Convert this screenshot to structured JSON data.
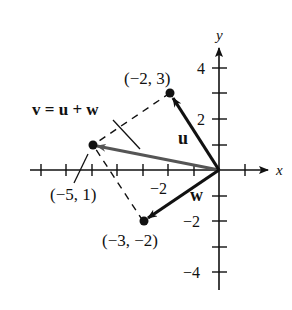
{
  "diagram": {
    "axes": {
      "x_label": "x",
      "y_label": "y",
      "x_ticks": [
        -7,
        -6,
        -5,
        -4,
        -3,
        -2,
        -1,
        1
      ],
      "y_ticks": [
        -4,
        -3,
        -2,
        -1,
        1,
        2,
        3,
        4
      ],
      "x_tick_labels": [
        {
          "value": -2,
          "text": "−2"
        }
      ],
      "y_tick_labels": [
        {
          "value": 4,
          "text": "4"
        },
        {
          "value": 2,
          "text": "2"
        },
        {
          "value": -2,
          "text": "−2"
        },
        {
          "value": -4,
          "text": "−4"
        }
      ]
    },
    "points": [
      {
        "id": "u_tip",
        "x": -2,
        "y": 3,
        "label": "(−2, 3)"
      },
      {
        "id": "v_tip",
        "x": -5,
        "y": 1,
        "label": "(−5, 1)"
      },
      {
        "id": "w_tip",
        "x": -3,
        "y": -2,
        "label": "(−3, −2)"
      }
    ],
    "vectors": [
      {
        "name": "u",
        "from": [
          0,
          0
        ],
        "to": [
          -2,
          3
        ],
        "label": "u",
        "color": "#111111"
      },
      {
        "name": "w",
        "from": [
          0,
          0
        ],
        "to": [
          -3,
          -2
        ],
        "label": "w",
        "color": "#111111"
      },
      {
        "name": "v",
        "from": [
          0,
          0
        ],
        "to": [
          -5,
          1
        ],
        "label": "v = u + w",
        "color": "#555555"
      }
    ],
    "dashed_segments": [
      {
        "from": [
          -2,
          3
        ],
        "to": [
          -5,
          1
        ]
      },
      {
        "from": [
          -3,
          -2
        ],
        "to": [
          -5,
          1
        ]
      }
    ],
    "equation_label": "v = u + w"
  }
}
